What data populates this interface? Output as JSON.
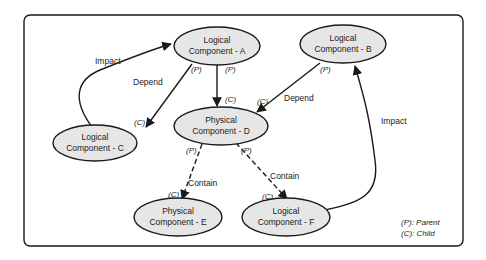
{
  "colors": {
    "node_fill": "#e6e6e6",
    "stroke": "#1a1a1a",
    "background": "#ffffff"
  },
  "nodes": {
    "A": {
      "line1": "Logical",
      "line2": "Component - A"
    },
    "B": {
      "line1": "Logical",
      "line2": "Component - B"
    },
    "C": {
      "line1": "Logical",
      "line2": "Component - C"
    },
    "D": {
      "line1": "Physical",
      "line2": "Component - D"
    },
    "E": {
      "line1": "Physical",
      "line2": "Component - E"
    },
    "F": {
      "line1": "Logical",
      "line2": "Component - F"
    }
  },
  "edges": {
    "c_to_a": {
      "label": "Impact",
      "style": "solid"
    },
    "a_to_c": {
      "label": "Depend",
      "style": "solid",
      "from_role": "(P)",
      "to_role": "(C)"
    },
    "a_to_d": {
      "label": "",
      "style": "solid",
      "from_role": "(P)",
      "to_role": "(C)"
    },
    "b_to_d": {
      "label": "Depend",
      "style": "solid",
      "from_role": "(P)",
      "to_role": "(C)"
    },
    "f_to_b": {
      "label": "Impact",
      "style": "solid"
    },
    "d_to_e": {
      "label": "Contain",
      "style": "dashed",
      "from_role": "(P)",
      "to_role": "(C)"
    },
    "d_to_f": {
      "label": "Contain",
      "style": "dashed",
      "from_role": "(P)",
      "to_role": "(C)"
    }
  },
  "legend": {
    "parent": "(P): Parent",
    "child": "(C): Child"
  }
}
